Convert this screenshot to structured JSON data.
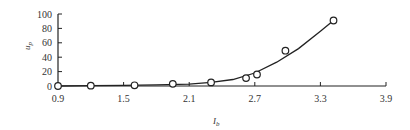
{
  "chart_data": {
    "type": "scatter",
    "title": "",
    "xlabel": "I_b",
    "ylabel": "u_p",
    "xlim": [
      0.9,
      3.9
    ],
    "ylim": [
      0,
      100
    ],
    "xticks": [
      0.9,
      1.5,
      2.1,
      2.7,
      3.3,
      3.9
    ],
    "yticks": [
      0,
      20,
      40,
      60,
      80,
      100
    ],
    "grid": false,
    "legend": null,
    "series": [
      {
        "name": "measured",
        "style": "open-circle",
        "x": [
          0.9,
          1.2,
          1.6,
          1.95,
          2.3,
          2.62,
          2.72,
          2.98,
          3.42
        ],
        "y": [
          0,
          0.5,
          1,
          3,
          5,
          11,
          16,
          49,
          91
        ]
      },
      {
        "name": "fit",
        "style": "line",
        "x": [
          0.9,
          1.2,
          1.5,
          1.8,
          2.1,
          2.3,
          2.5,
          2.7,
          2.9,
          3.1,
          3.3,
          3.42
        ],
        "y": [
          0,
          0.5,
          1,
          1.5,
          2.5,
          5,
          9,
          18,
          33,
          52,
          76,
          91
        ]
      }
    ]
  },
  "labels": {
    "xlabel_main": "I",
    "xlabel_sub": "b",
    "ylabel_main": "u",
    "ylabel_sub": "p"
  }
}
